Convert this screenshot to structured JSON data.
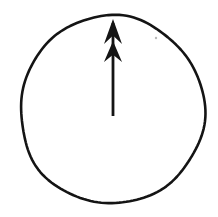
{
  "figure": {
    "description": "A hand-drawn circle outline containing a vertical arrow pointing upward with two stacked arrowheads, rising from the centre to the top of the circle.",
    "canvas": {
      "width": 218,
      "height": 217,
      "background_color": "#ffffff"
    },
    "ink_color": "#141414",
    "shapes": {
      "circle": {
        "name": "circle-outline",
        "center_x": 112,
        "center_y": 110,
        "radius_x": 92,
        "radius_y": 94,
        "stroke_width": 2.6,
        "stroke_color": "#141414",
        "fill": "none",
        "style": "hand-drawn"
      },
      "arrow": {
        "name": "up-arrow",
        "direction": "up",
        "shaft_x": 113,
        "tip_y": 19,
        "tail_y": 116,
        "shaft_width": 2.8,
        "fill_color": "#141414",
        "barb_count": 2,
        "upper_barb": {
          "tip_y": 19,
          "base_y": 44,
          "half_width": 9
        },
        "lower_barb": {
          "tip_y": 41,
          "base_y": 62,
          "half_width": 9
        }
      },
      "speck": {
        "name": "ink-speck",
        "x": 156,
        "y": 38,
        "radius": 1.2,
        "color": "#b9b9b9"
      }
    }
  }
}
